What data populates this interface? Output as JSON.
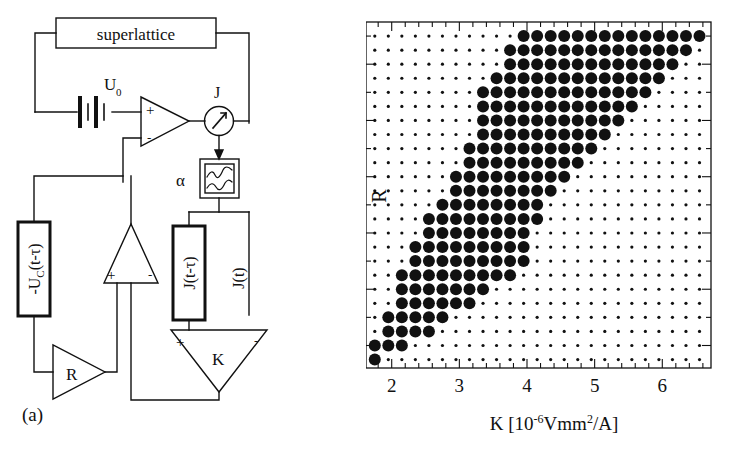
{
  "figure": {
    "panels": [
      {
        "id": "a",
        "label": "(a)",
        "caption": "circuit diagram"
      },
      {
        "id": "b",
        "label": "(b)",
        "caption": "parameter scan"
      }
    ]
  },
  "circuit": {
    "superlattice_label": "superlattice",
    "voltage_source_label": "U",
    "voltage_source_sub": "0",
    "current_label": "J",
    "filter_label": "α",
    "delay_voltage_label": "-U",
    "delay_voltage_sub": "C",
    "delay_voltage_arg": "(t-τ)",
    "delay_current_label": "J(t-τ)",
    "instant_current_label": "J(t)",
    "gain_r_label": "R",
    "gain_k_label": "K",
    "plus_sign": "+",
    "minus_sign": "-"
  },
  "chart_data": {
    "type": "scatter",
    "title": "",
    "xlabel": "K [10⁻⁶Vmm²/A]",
    "xlabel_parts": {
      "symbol": "K",
      "bracket_open": "[10",
      "exponent": "-6",
      "unit": "Vmm",
      "unit_exponent": "2",
      "denominator": "/A",
      "bracket_close": "]"
    },
    "ylabel": "R",
    "xlim": [
      1.62,
      6.72
    ],
    "ylim": [
      -0.28,
      0.95
    ],
    "xticks_major": [
      2,
      3,
      4,
      5,
      6
    ],
    "xticks_major_labels": [
      "2",
      "3",
      "4",
      "5",
      "6"
    ],
    "xticks_minor_step": 0.2,
    "yticks_major": [
      -0.2,
      0,
      0.2,
      0.4,
      0.6,
      0.8
    ],
    "yticks_major_labels": [
      "-0.2",
      "0",
      "0.2",
      "0.4",
      "0.6",
      "0.8"
    ],
    "yticks_minor_step": 0.1,
    "grid": false,
    "legend": null,
    "marker_small_radius_px": 1.6,
    "marker_large_radius_px": 6.0,
    "marker_color": "#111111",
    "x_values": [
      1.75,
      1.95,
      2.15,
      2.35,
      2.55,
      2.75,
      2.95,
      3.15,
      3.35,
      3.55,
      3.75,
      3.95,
      4.15,
      4.35,
      4.55,
      4.75,
      4.95,
      5.15,
      5.35,
      5.55,
      5.75,
      5.95,
      6.15,
      6.35,
      6.55
    ],
    "y_values": [
      0.9,
      0.85,
      0.8,
      0.75,
      0.7,
      0.65,
      0.6,
      0.55,
      0.5,
      0.45,
      0.4,
      0.35,
      0.3,
      0.25,
      0.2,
      0.15,
      0.1,
      0.05,
      0.0,
      -0.05,
      -0.1,
      -0.15,
      -0.2,
      -0.25
    ],
    "large_matrix": [
      [
        0,
        0,
        0,
        0,
        0,
        0,
        0,
        0,
        0,
        0,
        0,
        1,
        1,
        1,
        1,
        1,
        1,
        1,
        1,
        1,
        1,
        1,
        1,
        1,
        1
      ],
      [
        0,
        0,
        0,
        0,
        0,
        0,
        0,
        0,
        0,
        0,
        1,
        1,
        1,
        1,
        1,
        1,
        1,
        1,
        1,
        1,
        1,
        1,
        1,
        1,
        0
      ],
      [
        0,
        0,
        0,
        0,
        0,
        0,
        0,
        0,
        0,
        0,
        1,
        1,
        1,
        1,
        1,
        1,
        1,
        1,
        1,
        1,
        1,
        1,
        1,
        0,
        0
      ],
      [
        0,
        0,
        0,
        0,
        0,
        0,
        0,
        0,
        0,
        1,
        1,
        1,
        1,
        1,
        1,
        1,
        1,
        1,
        1,
        1,
        1,
        1,
        0,
        0,
        0
      ],
      [
        0,
        0,
        0,
        0,
        0,
        0,
        0,
        0,
        1,
        1,
        1,
        1,
        1,
        1,
        1,
        1,
        1,
        1,
        1,
        1,
        1,
        0,
        0,
        0,
        0
      ],
      [
        0,
        0,
        0,
        0,
        0,
        0,
        0,
        0,
        1,
        1,
        1,
        1,
        1,
        1,
        1,
        1,
        1,
        1,
        1,
        1,
        0,
        0,
        0,
        0,
        0
      ],
      [
        0,
        0,
        0,
        0,
        0,
        0,
        0,
        0,
        1,
        1,
        1,
        1,
        1,
        1,
        1,
        1,
        1,
        1,
        1,
        0,
        0,
        0,
        0,
        0,
        0
      ],
      [
        0,
        0,
        0,
        0,
        0,
        0,
        0,
        0,
        1,
        1,
        1,
        1,
        1,
        1,
        1,
        1,
        1,
        1,
        0,
        0,
        0,
        0,
        0,
        0,
        0
      ],
      [
        0,
        0,
        0,
        0,
        0,
        0,
        0,
        1,
        1,
        1,
        1,
        1,
        1,
        1,
        1,
        1,
        1,
        0,
        0,
        0,
        0,
        0,
        0,
        0,
        0
      ],
      [
        0,
        0,
        0,
        0,
        0,
        0,
        0,
        1,
        1,
        1,
        1,
        1,
        1,
        1,
        1,
        1,
        0,
        0,
        0,
        0,
        0,
        0,
        0,
        0,
        0
      ],
      [
        0,
        0,
        0,
        0,
        0,
        0,
        1,
        1,
        1,
        1,
        1,
        1,
        1,
        1,
        1,
        0,
        0,
        0,
        0,
        0,
        0,
        0,
        0,
        0,
        0
      ],
      [
        0,
        0,
        0,
        0,
        0,
        0,
        1,
        1,
        1,
        1,
        1,
        1,
        1,
        1,
        0,
        0,
        0,
        0,
        0,
        0,
        0,
        0,
        0,
        0,
        0
      ],
      [
        0,
        0,
        0,
        0,
        0,
        1,
        1,
        1,
        1,
        1,
        1,
        1,
        1,
        0,
        0,
        0,
        0,
        0,
        0,
        0,
        0,
        0,
        0,
        0,
        0
      ],
      [
        0,
        0,
        0,
        0,
        1,
        1,
        1,
        1,
        1,
        1,
        1,
        1,
        1,
        0,
        0,
        0,
        0,
        0,
        0,
        0,
        0,
        0,
        0,
        0,
        0
      ],
      [
        0,
        0,
        0,
        0,
        1,
        1,
        1,
        1,
        1,
        1,
        1,
        1,
        0,
        0,
        0,
        0,
        0,
        0,
        0,
        0,
        0,
        0,
        0,
        0,
        0
      ],
      [
        0,
        0,
        0,
        1,
        1,
        1,
        1,
        1,
        1,
        1,
        1,
        1,
        0,
        0,
        0,
        0,
        0,
        0,
        0,
        0,
        0,
        0,
        0,
        0,
        0
      ],
      [
        0,
        0,
        0,
        1,
        1,
        1,
        1,
        1,
        1,
        1,
        1,
        1,
        0,
        0,
        0,
        0,
        0,
        0,
        0,
        0,
        0,
        0,
        0,
        0,
        0
      ],
      [
        0,
        0,
        1,
        1,
        1,
        1,
        1,
        1,
        1,
        1,
        1,
        0,
        0,
        0,
        0,
        0,
        0,
        0,
        0,
        0,
        0,
        0,
        0,
        0,
        0
      ],
      [
        0,
        0,
        1,
        1,
        1,
        1,
        1,
        1,
        1,
        0,
        0,
        0,
        0,
        0,
        0,
        0,
        0,
        0,
        0,
        0,
        0,
        0,
        0,
        0,
        0
      ],
      [
        0,
        0,
        1,
        1,
        1,
        1,
        1,
        1,
        0,
        0,
        0,
        0,
        0,
        0,
        0,
        0,
        0,
        0,
        0,
        0,
        0,
        0,
        0,
        0,
        0
      ],
      [
        0,
        1,
        1,
        1,
        1,
        1,
        0,
        0,
        0,
        0,
        0,
        0,
        0,
        0,
        0,
        0,
        0,
        0,
        0,
        0,
        0,
        0,
        0,
        0,
        0
      ],
      [
        0,
        1,
        1,
        1,
        1,
        0,
        0,
        0,
        0,
        0,
        0,
        0,
        0,
        0,
        0,
        0,
        0,
        0,
        0,
        0,
        0,
        0,
        0,
        0,
        0
      ],
      [
        1,
        1,
        1,
        0,
        0,
        0,
        0,
        0,
        0,
        0,
        0,
        0,
        0,
        0,
        0,
        0,
        0,
        0,
        0,
        0,
        0,
        0,
        0,
        0,
        0
      ],
      [
        1,
        0,
        0,
        0,
        0,
        0,
        0,
        0,
        0,
        0,
        0,
        0,
        0,
        0,
        0,
        0,
        0,
        0,
        0,
        0,
        0,
        0,
        0,
        0,
        0
      ]
    ]
  }
}
